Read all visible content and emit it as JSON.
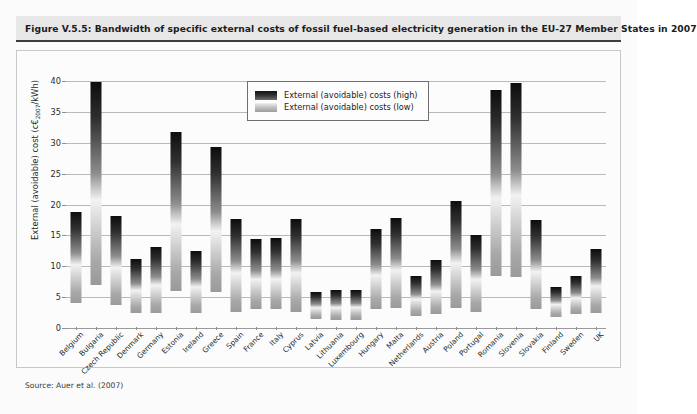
{
  "figure": {
    "title": "Figure V.5.5: Bandwidth of specific external costs of fossil fuel-based electricity generation in the EU-27 Member States in 2007",
    "source": "Source: Auer et al. (2007)"
  },
  "legend": {
    "position": "top-center-inside",
    "entries": [
      {
        "label": "External (avoidable) costs (high)",
        "swatch": "high-gradient-dark"
      },
      {
        "label": "External (avoidable) costs (low)",
        "swatch": "low-gradient-light"
      }
    ]
  },
  "colors": {
    "title_band": "#e7e7e7",
    "title_rule": "#3d3d3d",
    "plot_background": "#fcfcfc",
    "gridline": "#b9b9b9",
    "bar_high": "#0d0d0d",
    "bar_low": "#a8a8a8",
    "text": "#231f20"
  },
  "chart_data": {
    "type": "bar",
    "title": "Bandwidth of specific external costs of fossil fuel-based electricity generation in the EU-27 Member States in 2007",
    "subtitle": "",
    "xlabel": "",
    "ylabel": "External (avoidable) cost (c€2007/kWh)",
    "ylim": [
      0,
      41
    ],
    "yticks": [
      0,
      5,
      10,
      15,
      20,
      25,
      30,
      35,
      40
    ],
    "ytick_labels": [
      "0",
      "5",
      "10",
      "15",
      "20",
      "25",
      "30",
      "35",
      "40"
    ],
    "grid": true,
    "legend_position": "inside top-center",
    "note": "Floating bars: each bar spans from the low external cost estimate to the high external cost estimate.",
    "categories": [
      "Belgium",
      "Bulgaria",
      "Czech Republic",
      "Denmark",
      "Germany",
      "Estonia",
      "Ireland",
      "Greece",
      "Spain",
      "France",
      "Italy",
      "Cyprus",
      "Latvia",
      "Lithuania",
      "Luxembourg",
      "Hungary",
      "Malta",
      "Netherlands",
      "Austria",
      "Poland",
      "Portugal",
      "Romania",
      "Slovenia",
      "Slovakia",
      "Finland",
      "Sweden",
      "UK"
    ],
    "series": [
      {
        "name": "External (avoidable) costs (low)",
        "values": [
          4.0,
          7.0,
          3.8,
          2.5,
          2.5,
          6.0,
          2.5,
          5.8,
          2.6,
          3.0,
          3.0,
          2.6,
          1.5,
          1.3,
          1.3,
          3.0,
          3.2,
          2.0,
          2.2,
          3.2,
          2.6,
          8.4,
          8.3,
          3.0,
          1.8,
          2.2,
          2.5
        ]
      },
      {
        "name": "External (avoidable) costs (high)",
        "values": [
          18.8,
          39.8,
          18.2,
          11.2,
          13.2,
          31.8,
          12.5,
          29.4,
          17.6,
          14.5,
          14.6,
          17.7,
          5.9,
          6.2,
          6.1,
          16.0,
          17.8,
          8.4,
          11.1,
          20.6,
          15.0,
          38.6,
          39.7,
          17.5,
          6.6,
          8.5,
          12.8
        ]
      }
    ]
  }
}
